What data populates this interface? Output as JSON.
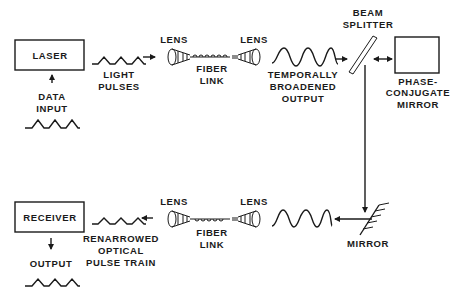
{
  "diagram": {
    "laser": "LASER",
    "data_input": [
      "DATA",
      "INPUT"
    ],
    "light_pulses": [
      "LIGHT",
      "PULSES"
    ],
    "lens": "LENS",
    "fiber_link": [
      "FIBER",
      "LINK"
    ],
    "temporally_broadened_output": [
      "TEMPORALLY",
      "BROADENED",
      "OUTPUT"
    ],
    "beam_splitter": [
      "BEAM",
      "SPLITTER"
    ],
    "phase_conjugate_mirror": [
      "PHASE-",
      "CONJUGATE",
      "MIRROR"
    ],
    "mirror": "MIRROR",
    "receiver": "RECEIVER",
    "renarrowed_pulse_train": [
      "RENARROWED",
      "OPTICAL",
      "PULSE TRAIN"
    ],
    "output": "OUTPUT"
  },
  "colors": {
    "ink": "#1a1a1a",
    "background": "#ffffff"
  }
}
